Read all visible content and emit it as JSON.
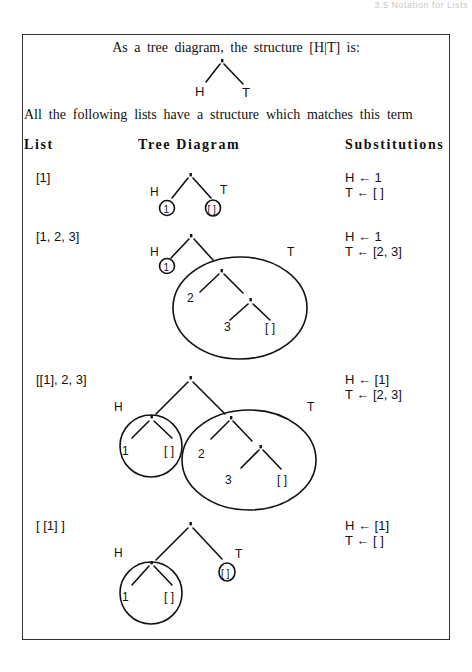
{
  "running_head": "3.5 Notation for Lists",
  "intro": {
    "line1": "As a tree diagram, the structure [H|T] is:",
    "line2": "All the following lists have a structure which matches this term"
  },
  "header_tree": {
    "left_label": "H",
    "right_label": "T",
    "root": "."
  },
  "columns": {
    "list": "List",
    "tree": "Tree Diagram",
    "substitutions": "Substitutions"
  },
  "rows": [
    {
      "list": "[1]",
      "tree": {
        "H": "H",
        "T": "T",
        "head": "1",
        "tail": "[ ]"
      },
      "subs": [
        "H ←  1",
        "T ←  [ ]"
      ]
    },
    {
      "list": "[1, 2, 3]",
      "tree": {
        "H": "H",
        "T": "T",
        "head": "1",
        "n2": "2",
        "n3": "3",
        "nil": "[ ]"
      },
      "subs": [
        "H ←  1",
        "T ←  [2, 3]"
      ]
    },
    {
      "list": "[[1], 2, 3]",
      "tree": {
        "H": "H",
        "T": "T",
        "h1": "1",
        "hnil": "[ ]",
        "n2": "2",
        "n3": "3",
        "nil": "[ ]"
      },
      "subs": [
        "H ←  [1]",
        "T ←  [2, 3]"
      ]
    },
    {
      "list": "[ [1] ]",
      "tree": {
        "H": "H",
        "T": "T",
        "h1": "1",
        "hnil": "[ ]",
        "tail": "[ ]"
      },
      "subs": [
        "H ←  [1]",
        "T ←  [ ]"
      ]
    }
  ],
  "colors": {
    "ink": "#111111",
    "frame": "#333333",
    "background": "#ffffff"
  }
}
